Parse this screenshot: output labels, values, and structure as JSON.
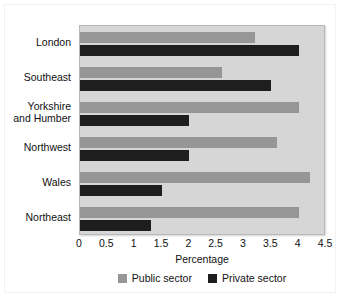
{
  "chart_data": {
    "type": "bar",
    "orientation": "horizontal",
    "title": "",
    "xlabel": "Percentage",
    "ylabel": "",
    "xlim": [
      0,
      4.5
    ],
    "xticks": [
      "0",
      "0.5",
      "1",
      "1.5",
      "2",
      "2.5",
      "3",
      "3.5",
      "4",
      "4.5"
    ],
    "xtick_values": [
      0,
      0.5,
      1,
      1.5,
      2,
      2.5,
      3,
      3.5,
      4,
      4.5
    ],
    "grid": false,
    "legend_position": "bottom-center",
    "categories": [
      "London",
      "Southeast",
      "Yorkshire and Humber",
      "Northwest",
      "Wales",
      "Northeast"
    ],
    "category_labels": [
      [
        "London"
      ],
      [
        "Southeast"
      ],
      [
        "Yorkshire",
        "and Humber"
      ],
      [
        "Northwest"
      ],
      [
        "Wales"
      ],
      [
        "Northeast"
      ]
    ],
    "series": [
      {
        "name": "Public sector",
        "color": "#969696",
        "values": [
          3.2,
          2.6,
          4.0,
          3.6,
          4.2,
          4.0
        ]
      },
      {
        "name": "Private sector",
        "color": "#1e1e1e",
        "values": [
          4.0,
          3.5,
          2.0,
          2.0,
          1.5,
          1.3
        ]
      }
    ]
  },
  "legend": {
    "entries": [
      {
        "label": "Public sector",
        "color": "#969696"
      },
      {
        "label": "Private sector",
        "color": "#1e1e1e"
      }
    ]
  },
  "colors": {
    "plot_background": "#d6d6d6",
    "figure_background": "#ffffff",
    "public_sector": "#969696",
    "private_sector": "#1e1e1e",
    "text": "#111111"
  }
}
